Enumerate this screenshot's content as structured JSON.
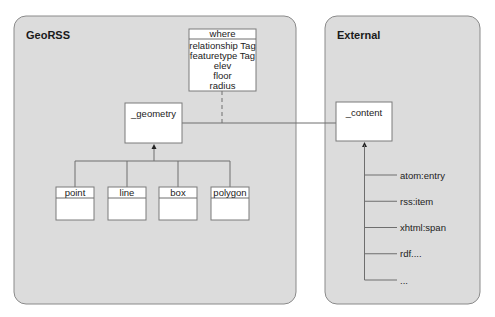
{
  "panels": {
    "left": {
      "title": "GeoRSS"
    },
    "right": {
      "title": "External"
    }
  },
  "where_box": {
    "header": "where",
    "attributes": [
      "relationship Tag",
      "featuretype Tag",
      "elev",
      "floor",
      "radius"
    ]
  },
  "geometry_box": {
    "label": "_geometry"
  },
  "content_box": {
    "label": "_content"
  },
  "geometry_subtypes": [
    "point",
    "line",
    "box",
    "polygon"
  ],
  "content_subtypes": [
    "atom:entry",
    "rss:item",
    "xhtml:span",
    "rdf....",
    "..."
  ],
  "colors": {
    "panel_fill": "#dcdcdc",
    "panel_stroke": "#8a8a8a",
    "box_fill": "#ffffff",
    "line": "#6e6e6e"
  }
}
